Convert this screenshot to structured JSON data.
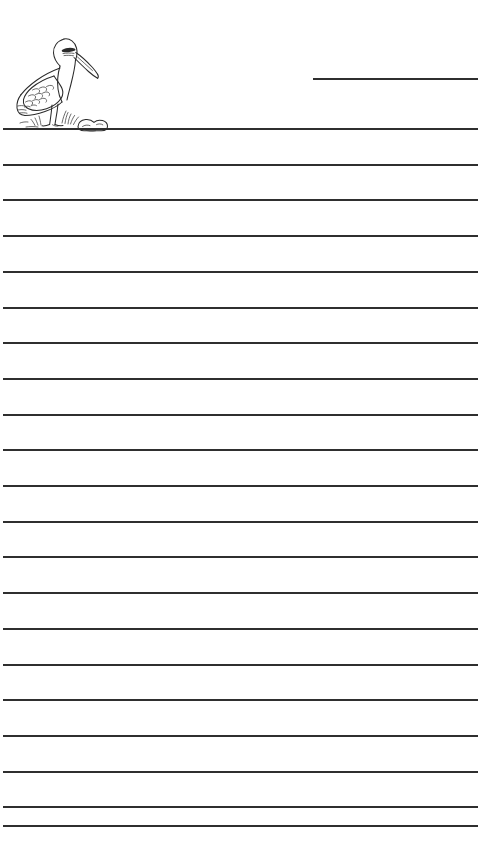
{
  "page": {
    "width": 504,
    "height": 864,
    "background_color": "#ffffff",
    "rule_color": "#2f2f2f",
    "rule_thickness_px": 2
  },
  "artwork": {
    "name": "pelican-illustration",
    "subject": "pelican standing on ground with grass tufts and a rock",
    "style": "black and white line drawing",
    "ink_color": "#2b2b2b",
    "position": {
      "left": 8,
      "top": 26,
      "width": 130,
      "height": 108
    }
  },
  "header_line": {
    "name": "name-blank-line",
    "x_start": 313,
    "x_end": 478,
    "y": 78,
    "label": ""
  },
  "rules": {
    "count": 21,
    "x_start": 3,
    "x_end": 478,
    "spacing_px": 35.7,
    "y_positions": [
      128,
      163.7,
      199.4,
      235.1,
      270.8,
      306.5,
      342.2,
      377.9,
      413.6,
      449.3,
      485,
      520.7,
      556.4,
      592.1,
      627.8,
      663.5,
      699.2,
      734.9,
      770.6,
      806.3,
      825
    ]
  }
}
